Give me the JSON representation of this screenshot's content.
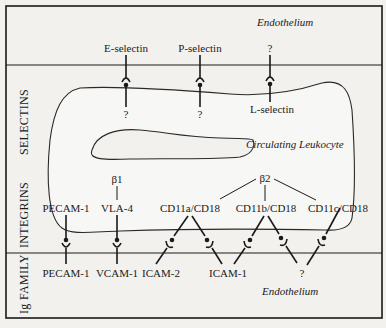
{
  "figure": {
    "sections": [
      {
        "id": "selectins",
        "label": "SELECTINS"
      },
      {
        "id": "integrins",
        "label": "INTEGRINS"
      },
      {
        "id": "ig_family",
        "label": "Ig FAMILY"
      }
    ],
    "regions": {
      "endothelium_top": "Endothelium",
      "endothelium_bottom": "Endothelium",
      "leukocyte": "Circulating Leukocyte"
    },
    "selectins": {
      "e_selectin": {
        "top": "E-selectin",
        "bottom": "?"
      },
      "p_selectin": {
        "top": "P-selectin",
        "bottom": "?"
      },
      "l_selectin": {
        "top": "?",
        "bottom": "L-selectin"
      }
    },
    "integrins": {
      "beta1": "β1",
      "beta2": "β2",
      "pecam_leuk": "PECAM-1",
      "vla4": "VLA-4",
      "cd11a": "CD11a/CD18",
      "cd11b": "CD11b/CD18",
      "cd11c": "CD11c/CD18"
    },
    "ig_family": {
      "pecam_endo": "PECAM-1",
      "vcam1": "VCAM-1",
      "icam2": "ICAM-2",
      "icam1": "ICAM-1",
      "unknown": "?"
    }
  },
  "colors": {
    "ink": "#1a1a1a",
    "paper": "#f2f1ee"
  }
}
